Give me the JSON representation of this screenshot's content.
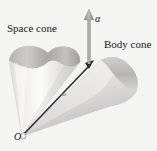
{
  "figure": {
    "background_color": "#f4f4f3",
    "labels": {
      "space_cone": "Space cone",
      "body_cone": "Body cone",
      "alpha": "α",
      "omega": "ω",
      "origin": "O"
    },
    "colors": {
      "cone_light": "#f0efee",
      "cone_mid": "#cfcecb",
      "cone_dark": "#a9a8a4",
      "arrow": "#2b2b2b",
      "alpha_arrow": "#8d8c89",
      "text": "#1a1a1a"
    },
    "geometry": {
      "apex": {
        "x": 22,
        "y": 136
      },
      "omega_arrow_tip": {
        "x": 93,
        "y": 62
      },
      "alpha_arrow_base": {
        "x": 89,
        "y": 63
      },
      "alpha_arrow_tip": {
        "x": 89,
        "y": 11
      }
    }
  }
}
